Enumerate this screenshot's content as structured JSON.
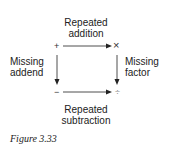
{
  "diagram": {
    "nodes": {
      "top_left": "+",
      "top_right": "×",
      "bottom_left": "−",
      "bottom_right": "÷"
    },
    "edges": {
      "top": {
        "line1": "Repeated",
        "line2": "addition"
      },
      "left": {
        "line1": "Missing",
        "line2": "addend"
      },
      "right": {
        "line1": "Missing",
        "line2": "factor"
      },
      "bottom": {
        "line1": "Repeated",
        "line2": "subtraction"
      }
    }
  },
  "caption": "Figure 3.33"
}
